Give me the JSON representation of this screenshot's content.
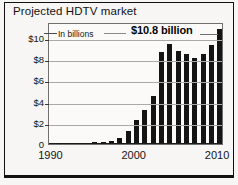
{
  "chart_data": {
    "type": "bar",
    "title": "Projected HDTV market",
    "subtitle": "In billions",
    "xlabel": "",
    "ylabel": "",
    "ylim": [
      0,
      11.5
    ],
    "grid": true,
    "legend_position": "none",
    "annotation": "$10.8 billion",
    "ytick_labels": [
      "$10",
      "$8",
      "$6",
      "$4",
      "$2",
      "0"
    ],
    "ytick_values": [
      10,
      8,
      6,
      4,
      2,
      0
    ],
    "xtick_labels": [
      "1990",
      "2000",
      "2010"
    ],
    "xtick_values": [
      1990,
      2000,
      2010
    ],
    "categories": [
      "1990",
      "1991",
      "1992",
      "1993",
      "1994",
      "1995",
      "1996",
      "1997",
      "1998",
      "1999",
      "2000",
      "2001",
      "2002",
      "2003",
      "2004",
      "2005",
      "2006",
      "2007",
      "2008",
      "2009",
      "2010"
    ],
    "values": [
      0.0,
      0.0,
      0.05,
      0.05,
      0.1,
      0.15,
      0.2,
      0.25,
      0.6,
      1.2,
      2.3,
      3.2,
      4.5,
      8.7,
      9.4,
      8.8,
      8.5,
      8.15,
      8.5,
      9.3,
      10.8
    ],
    "bar_color": "#141414"
  },
  "chart": {
    "title": "Projected HDTV market",
    "units_note": "In billions",
    "callout": "$10.8 billion"
  },
  "colors": {
    "bar": "#141414",
    "grid": "#a9a9a9",
    "frame": "#6f6f6f",
    "outer_border": "#111111",
    "background": "#f7f6f4",
    "plot_background": "#fbfaf8",
    "text": "#141414"
  }
}
